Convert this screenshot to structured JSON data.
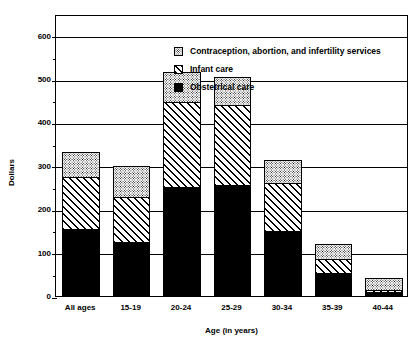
{
  "chart_data": {
    "type": "bar",
    "subtype": "stacked-bar",
    "title": "",
    "xlabel": "Age (in years)",
    "ylabel": "Dollars",
    "categories": [
      "All ages",
      "15-19",
      "20-24",
      "25-29",
      "30-34",
      "35-39",
      "40-44"
    ],
    "series": [
      {
        "name": "Obstetrical care",
        "pattern": "solid-black",
        "values": [
          152,
          122,
          248,
          253,
          147,
          50,
          8
        ]
      },
      {
        "name": "Infant care",
        "pattern": "diagonal-hatch",
        "values": [
          120,
          104,
          197,
          184,
          111,
          32,
          4
        ]
      },
      {
        "name": "Contraception, abortion, and infertility services",
        "pattern": "stipple-dot",
        "values": [
          58,
          71,
          68,
          65,
          54,
          35,
          28
        ]
      }
    ],
    "totals": [
      330,
      297,
      513,
      502,
      312,
      117,
      40
    ],
    "ylim": [
      0,
      650
    ],
    "yticks": [
      0,
      100,
      200,
      300,
      400,
      500,
      600
    ],
    "ytick_labels": [
      "0",
      "100",
      "200",
      "300",
      "400",
      "500",
      "600"
    ],
    "grid": "horizontal",
    "legend_position": "inside-top-center"
  },
  "axes": {
    "y_title": "Dollars",
    "x_title": "Age (in years)"
  },
  "legend": {
    "entries": [
      {
        "label": "Contraception, abortion, and infertility services",
        "pattern": "stipple-dot"
      },
      {
        "label": "Infant care",
        "pattern": "diagonal-hatch"
      },
      {
        "label": "Obstetrical care",
        "pattern": "solid-black"
      }
    ]
  },
  "colors": {
    "ink": "#000000",
    "background": "#ffffff"
  }
}
